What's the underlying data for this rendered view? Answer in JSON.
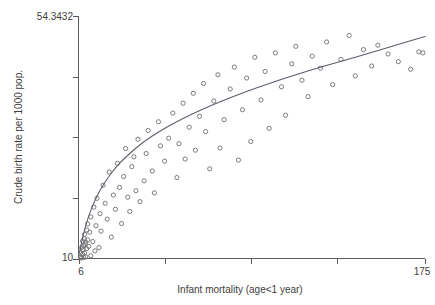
{
  "chart_data": {
    "type": "scatter",
    "title": "",
    "xlabel": "Infant mortality (age<1 year)",
    "ylabel": "Crude birth rate per 1000 pop.",
    "xlim": [
      6,
      175
    ],
    "ylim": [
      10,
      54.3432
    ],
    "x_tick_labels": [
      "6",
      "175"
    ],
    "y_tick_labels": [
      "54.3432",
      "10"
    ],
    "x_ticks": [
      6,
      48,
      90,
      132,
      175
    ],
    "y_ticks": [
      10,
      21.1,
      32.2,
      43.2,
      54.3432
    ],
    "grid": false,
    "legend": null,
    "marker_style": "open-circle",
    "series": [
      {
        "name": "countries",
        "points": [
          [
            7,
            10.2
          ],
          [
            7,
            11.1
          ],
          [
            7.5,
            10.1
          ],
          [
            7.5,
            12.0
          ],
          [
            8,
            10.8
          ],
          [
            8,
            13.2
          ],
          [
            8.2,
            11.6
          ],
          [
            8.5,
            10.2
          ],
          [
            8.5,
            12.3
          ],
          [
            8.8,
            13.6
          ],
          [
            9,
            11.0
          ],
          [
            9,
            14.4
          ],
          [
            9.2,
            12.6
          ],
          [
            9.5,
            10.3
          ],
          [
            9.5,
            13.0
          ],
          [
            10,
            11.8
          ],
          [
            10,
            15.2
          ],
          [
            10.5,
            13.4
          ],
          [
            10.5,
            16.3
          ],
          [
            11,
            12.2
          ],
          [
            11.5,
            14.8
          ],
          [
            12,
            10.5
          ],
          [
            12,
            17.6
          ],
          [
            13,
            13.1
          ],
          [
            13.5,
            19.4
          ],
          [
            14,
            11.4
          ],
          [
            14.5,
            16.0
          ],
          [
            15,
            21.0
          ],
          [
            16,
            12.0
          ],
          [
            16.5,
            18.2
          ],
          [
            17,
            15.0
          ],
          [
            18,
            23.4
          ],
          [
            19,
            20.1
          ],
          [
            20,
            17.2
          ],
          [
            21,
            25.8
          ],
          [
            22,
            13.9
          ],
          [
            23,
            21.6
          ],
          [
            24,
            19.0
          ],
          [
            25,
            27.4
          ],
          [
            26,
            23.0
          ],
          [
            27,
            16.4
          ],
          [
            28,
            25.0
          ],
          [
            29,
            30.1
          ],
          [
            30,
            21.2
          ],
          [
            31,
            18.6
          ],
          [
            32,
            26.8
          ],
          [
            33,
            28.6
          ],
          [
            34,
            22.4
          ],
          [
            35,
            31.8
          ],
          [
            36,
            20.4
          ],
          [
            38,
            24.2
          ],
          [
            39,
            29.2
          ],
          [
            40,
            33.4
          ],
          [
            42,
            26.0
          ],
          [
            43,
            22.0
          ],
          [
            45,
            35.0
          ],
          [
            46,
            30.6
          ],
          [
            48,
            27.8
          ],
          [
            50,
            32.0
          ],
          [
            52,
            36.6
          ],
          [
            54,
            24.8
          ],
          [
            55,
            31.0
          ],
          [
            57,
            38.4
          ],
          [
            58,
            28.2
          ],
          [
            60,
            34.0
          ],
          [
            62,
            40.2
          ],
          [
            63,
            29.8
          ],
          [
            65,
            36.0
          ],
          [
            67,
            42.0
          ],
          [
            68,
            33.2
          ],
          [
            70,
            26.4
          ],
          [
            72,
            38.8
          ],
          [
            74,
            43.6
          ],
          [
            75,
            30.2
          ],
          [
            77,
            35.4
          ],
          [
            80,
            41.0
          ],
          [
            82,
            45.0
          ],
          [
            84,
            28.0
          ],
          [
            86,
            37.2
          ],
          [
            88,
            43.0
          ],
          [
            90,
            31.4
          ],
          [
            92,
            46.8
          ],
          [
            95,
            39.0
          ],
          [
            97,
            44.2
          ],
          [
            99,
            33.8
          ],
          [
            102,
            47.6
          ],
          [
            105,
            41.4
          ],
          [
            107,
            36.2
          ],
          [
            110,
            45.6
          ],
          [
            112,
            48.8
          ],
          [
            115,
            42.6
          ],
          [
            118,
            39.6
          ],
          [
            120,
            47.0
          ],
          [
            124,
            44.8
          ],
          [
            127,
            49.6
          ],
          [
            130,
            41.8
          ],
          [
            134,
            46.4
          ],
          [
            138,
            50.8
          ],
          [
            141,
            43.4
          ],
          [
            145,
            48.2
          ],
          [
            149,
            45.2
          ],
          [
            152,
            49.0
          ],
          [
            157,
            47.4
          ],
          [
            162,
            46.0
          ],
          [
            168,
            44.6
          ],
          [
            172,
            47.8
          ],
          [
            174,
            47.6
          ]
        ]
      }
    ],
    "fit_curve": {
      "name": "fitted trend",
      "shape": "concave-down logarithmic",
      "points": [
        [
          6.5,
          11.0
        ],
        [
          8,
          13.8
        ],
        [
          10,
          16.6
        ],
        [
          12,
          18.8
        ],
        [
          15,
          21.4
        ],
        [
          18,
          23.4
        ],
        [
          22,
          25.6
        ],
        [
          26,
          27.4
        ],
        [
          31,
          29.2
        ],
        [
          36,
          30.8
        ],
        [
          42,
          32.4
        ],
        [
          49,
          34.0
        ],
        [
          57,
          35.6
        ],
        [
          66,
          37.2
        ],
        [
          76,
          38.8
        ],
        [
          87,
          40.4
        ],
        [
          99,
          42.0
        ],
        [
          112,
          43.6
        ],
        [
          126,
          45.2
        ],
        [
          141,
          46.8
        ],
        [
          157,
          48.6
        ],
        [
          175,
          50.6
        ]
      ]
    }
  }
}
